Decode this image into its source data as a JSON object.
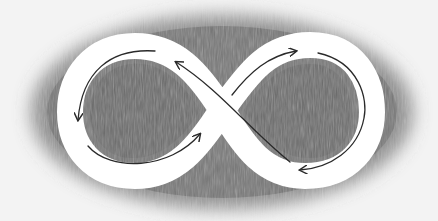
{
  "illustration": {
    "subject": "infinity symbol",
    "style": "pencil drawing",
    "colors": {
      "paper": "#f3f3f3",
      "shading": "#7a7a7a",
      "shading_dark": "#626262",
      "band": "#ffffff",
      "arrow": "#2a2a2a"
    },
    "arrows": [
      {
        "name": "top-left-arrow",
        "direction": "counterclockwise, pointing down"
      },
      {
        "name": "bottom-left-arrow",
        "direction": "pointing up-right"
      },
      {
        "name": "crossing-up-left-arrow",
        "direction": "pointing up-left"
      },
      {
        "name": "crossing-up-right-arrow",
        "direction": "pointing up-right"
      },
      {
        "name": "right-loop-arrow",
        "direction": "clockwise, pointing left"
      }
    ]
  }
}
